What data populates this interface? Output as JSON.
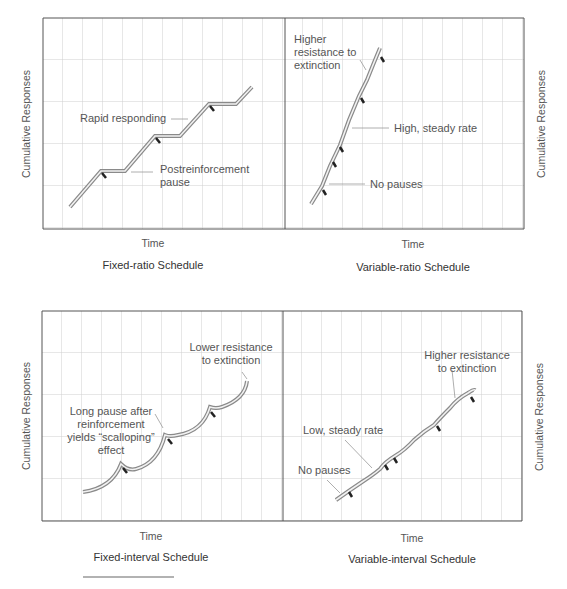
{
  "panels": [
    {
      "id": "fixed-ratio",
      "title": "Fixed-ratio Schedule",
      "xlabel": "Time",
      "ylabel": "Cumulative Responses",
      "annotations": [
        "Rapid responding",
        "Postreinforcement",
        "pause"
      ]
    },
    {
      "id": "variable-ratio",
      "title": "Variable-ratio Schedule",
      "xlabel": "Time",
      "ylabel": "Cumulative Responses",
      "annotations": [
        "Higher",
        "resistance to",
        "extinction",
        "High, steady rate",
        "No pauses"
      ]
    },
    {
      "id": "fixed-interval",
      "title": "Fixed-interval Schedule",
      "xlabel": "Time",
      "ylabel": "Cumulative Responses",
      "annotations": [
        "Lower resistance",
        "to extinction",
        "Long pause after",
        "reinforcement",
        "yields “scalloping”",
        "effect"
      ]
    },
    {
      "id": "variable-interval",
      "title": "Variable-interval Schedule",
      "xlabel": "Time",
      "ylabel": "Cumulative Responses",
      "annotations": [
        "Higher resistance",
        "to extinction",
        "Low, steady rate",
        "No pauses"
      ]
    }
  ],
  "colors": {
    "grid": "#c8c8c8",
    "border": "#555555",
    "curve_outer": "#8a8a8a",
    "curve_inner": "#f2f2f2",
    "reinforcement_mark": "#222222",
    "leader": "#999999"
  }
}
